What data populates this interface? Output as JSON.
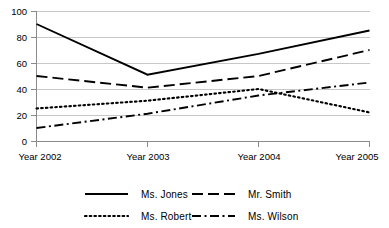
{
  "chart_data": {
    "type": "line",
    "title": "",
    "xlabel": "",
    "ylabel": "",
    "categories": [
      "Year 2002",
      "Year 2003",
      "Year 2004",
      "Year 2005"
    ],
    "ylim": [
      0,
      100
    ],
    "yticks": [
      0,
      20,
      40,
      60,
      80,
      100
    ],
    "grid": true,
    "legend_position": "bottom",
    "series": [
      {
        "name": "Ms. Jones",
        "style": "solid",
        "values": [
          90,
          51,
          67,
          85
        ]
      },
      {
        "name": "Mr. Smith",
        "style": "dashed",
        "values": [
          50,
          41,
          50,
          70
        ]
      },
      {
        "name": "Ms. Robert",
        "style": "dotted",
        "values": [
          25,
          31,
          40,
          22
        ]
      },
      {
        "name": "Ms.  Wilson",
        "style": "dash-dot",
        "values": [
          10,
          21,
          35,
          45
        ]
      }
    ],
    "colors": {
      "series_line": "#000000",
      "gridline": "#b9b9b9",
      "axis": "#8a8a8a",
      "background": "#ffffff",
      "text": "#000000"
    }
  },
  "axes": {
    "ytick_labels": [
      "100",
      "80",
      "60",
      "40",
      "20",
      "0"
    ],
    "xtick_labels": [
      "Year 2002",
      "Year 2003",
      "Year 2004",
      "Year 2005"
    ]
  },
  "legend": {
    "entries": [
      {
        "label": "Ms. Jones",
        "style": "solid"
      },
      {
        "label": "Mr. Smith",
        "style": "dashed"
      },
      {
        "label": "Ms. Robert",
        "style": "dotted"
      },
      {
        "label": "Ms.  Wilson",
        "style": "dash-dot"
      }
    ]
  }
}
